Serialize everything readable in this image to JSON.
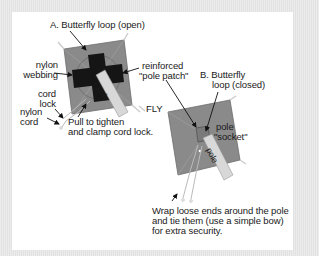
{
  "diagram": {
    "panel_a": {
      "title": "A. Butterfly loop (open)",
      "labels": {
        "nylon_webbing_1": "nylon",
        "nylon_webbing_2": "webbing",
        "cord_lock_1": "cord",
        "cord_lock_2": "lock",
        "nylon_cord_1": "nylon",
        "nylon_cord_2": "cord",
        "pull_1": "Pull to tighten",
        "pull_2": "and clamp cord lock.",
        "pole": "pole"
      }
    },
    "reinforced": {
      "line1": "reinforced",
      "line2": "\"pole patch\""
    },
    "fly": "FLY",
    "panel_b": {
      "title_1": "B. Butterfly",
      "title_2": "loop (closed)",
      "socket_1": "pole",
      "socket_2": "\"socket\"",
      "pole": "pole",
      "note_1": "Wrap loose ends around the pole",
      "note_2": "and tie them (use a simple bow)",
      "note_3": "for extra security."
    },
    "colors": {
      "fly_fabric": "#8a8a8a",
      "webbing": "#151515",
      "pole": "#d8d8d8",
      "background": "#e6e6e6",
      "card": "#ffffff"
    }
  }
}
